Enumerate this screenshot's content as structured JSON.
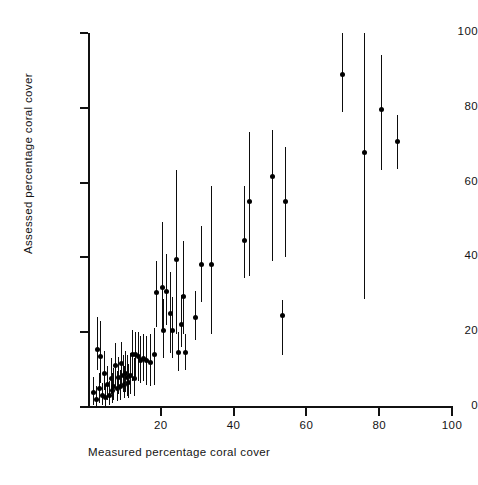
{
  "figure": {
    "background_color": "#ffffff",
    "ink_color": "#111111",
    "marker_color": "#000000"
  },
  "axes": {
    "x": {
      "label": "Measured percentage coral cover",
      "min": 0,
      "max": 100,
      "ticks": [
        0,
        20,
        40,
        60,
        80,
        100
      ],
      "tick_labels": [
        "",
        "20",
        "40",
        "60",
        "80",
        "100"
      ],
      "tick_direction": "out"
    },
    "y": {
      "label": "Assessed percentage coral cover",
      "min": 0,
      "max": 100,
      "ticks": [
        0,
        20,
        40,
        60,
        80,
        100
      ],
      "tick_labels": [
        "0",
        "20",
        "40",
        "60",
        "80",
        "100"
      ],
      "tick_direction": "out"
    },
    "spines": {
      "left": true,
      "bottom": true,
      "top": false,
      "right": false
    },
    "grid": false
  },
  "chart_data": {
    "type": "scatter",
    "title": "",
    "xlabel": "Measured percentage coral cover",
    "ylabel": "Assessed percentage coral cover",
    "xlim": [
      0,
      100
    ],
    "ylim": [
      0,
      100
    ],
    "grid": false,
    "legend": null,
    "error_bars": "vertical",
    "series": [
      {
        "name": "Assessed vs measured coral cover",
        "marker": "filled-circle",
        "points": [
          {
            "x": 1.5,
            "y": 4.0,
            "ylow": 0.5,
            "yhigh": 8.0
          },
          {
            "x": 2.2,
            "y": 2.0,
            "ylow": 0.0,
            "yhigh": 5.5
          },
          {
            "x": 2.6,
            "y": 15.5,
            "ylow": 10.0,
            "yhigh": 24.0
          },
          {
            "x": 3.0,
            "y": 5.0,
            "ylow": 1.0,
            "yhigh": 9.0
          },
          {
            "x": 3.4,
            "y": 13.5,
            "ylow": 6.5,
            "yhigh": 23.0
          },
          {
            "x": 3.8,
            "y": 3.0,
            "ylow": 0.5,
            "yhigh": 6.5
          },
          {
            "x": 4.4,
            "y": 9.0,
            "ylow": 4.5,
            "yhigh": 15.0
          },
          {
            "x": 4.8,
            "y": 2.5,
            "ylow": 0.0,
            "yhigh": 6.0
          },
          {
            "x": 5.3,
            "y": 6.0,
            "ylow": 2.0,
            "yhigh": 11.0
          },
          {
            "x": 5.8,
            "y": 3.0,
            "ylow": 0.5,
            "yhigh": 7.0
          },
          {
            "x": 6.2,
            "y": 7.5,
            "ylow": 3.5,
            "yhigh": 13.0
          },
          {
            "x": 6.6,
            "y": 4.5,
            "ylow": 1.0,
            "yhigh": 9.0
          },
          {
            "x": 7.0,
            "y": 5.5,
            "ylow": 2.0,
            "yhigh": 10.5
          },
          {
            "x": 7.5,
            "y": 11.0,
            "ylow": 5.0,
            "yhigh": 17.0
          },
          {
            "x": 7.9,
            "y": 5.0,
            "ylow": 1.5,
            "yhigh": 9.5
          },
          {
            "x": 8.3,
            "y": 8.0,
            "ylow": 3.5,
            "yhigh": 13.5
          },
          {
            "x": 8.7,
            "y": 5.5,
            "ylow": 2.0,
            "yhigh": 10.0
          },
          {
            "x": 9.1,
            "y": 11.5,
            "ylow": 6.0,
            "yhigh": 17.5
          },
          {
            "x": 9.5,
            "y": 8.5,
            "ylow": 4.0,
            "yhigh": 14.0
          },
          {
            "x": 9.9,
            "y": 6.0,
            "ylow": 2.5,
            "yhigh": 11.0
          },
          {
            "x": 10.3,
            "y": 9.0,
            "ylow": 4.0,
            "yhigh": 15.0
          },
          {
            "x": 10.7,
            "y": 8.0,
            "ylow": 3.0,
            "yhigh": 14.0
          },
          {
            "x": 11.1,
            "y": 6.5,
            "ylow": 2.5,
            "yhigh": 11.5
          },
          {
            "x": 11.6,
            "y": 8.5,
            "ylow": 3.5,
            "yhigh": 14.5
          },
          {
            "x": 12.0,
            "y": 14.0,
            "ylow": 7.0,
            "yhigh": 20.5
          },
          {
            "x": 12.5,
            "y": 7.5,
            "ylow": 3.0,
            "yhigh": 13.0
          },
          {
            "x": 13.0,
            "y": 14.0,
            "ylow": 7.5,
            "yhigh": 20.0
          },
          {
            "x": 13.6,
            "y": 13.5,
            "ylow": 7.0,
            "yhigh": 20.0
          },
          {
            "x": 14.3,
            "y": 12.5,
            "ylow": 6.5,
            "yhigh": 19.0
          },
          {
            "x": 15.0,
            "y": 13.0,
            "ylow": 7.0,
            "yhigh": 19.5
          },
          {
            "x": 16.0,
            "y": 12.5,
            "ylow": 6.0,
            "yhigh": 19.0
          },
          {
            "x": 17.0,
            "y": 12.0,
            "ylow": 5.5,
            "yhigh": 19.5
          },
          {
            "x": 18.0,
            "y": 14.0,
            "ylow": 6.0,
            "yhigh": 21.0
          },
          {
            "x": 18.8,
            "y": 30.5,
            "ylow": 21.5,
            "yhigh": 39.0
          },
          {
            "x": 20.2,
            "y": 32.0,
            "ylow": 20.5,
            "yhigh": 49.5
          },
          {
            "x": 20.7,
            "y": 20.5,
            "ylow": 13.0,
            "yhigh": 29.0
          },
          {
            "x": 21.5,
            "y": 31.0,
            "ylow": 22.0,
            "yhigh": 41.0
          },
          {
            "x": 22.4,
            "y": 25.0,
            "ylow": 14.5,
            "yhigh": 36.0
          },
          {
            "x": 23.0,
            "y": 20.5,
            "ylow": 13.0,
            "yhigh": 29.5
          },
          {
            "x": 24.3,
            "y": 39.5,
            "ylow": 19.5,
            "yhigh": 63.5
          },
          {
            "x": 24.8,
            "y": 14.5,
            "ylow": 9.5,
            "yhigh": 20.0
          },
          {
            "x": 25.6,
            "y": 22.0,
            "ylow": 16.0,
            "yhigh": 30.0
          },
          {
            "x": 26.2,
            "y": 29.5,
            "ylow": 19.5,
            "yhigh": 44.5
          },
          {
            "x": 26.6,
            "y": 14.5,
            "ylow": 10.0,
            "yhigh": 19.5
          },
          {
            "x": 29.4,
            "y": 24.0,
            "ylow": 18.0,
            "yhigh": 31.0
          },
          {
            "x": 31.0,
            "y": 38.0,
            "ylow": 28.0,
            "yhigh": 48.5
          },
          {
            "x": 33.8,
            "y": 38.0,
            "ylow": 19.5,
            "yhigh": 59.0
          },
          {
            "x": 42.8,
            "y": 44.5,
            "ylow": 34.5,
            "yhigh": 59.0
          },
          {
            "x": 44.2,
            "y": 55.0,
            "ylow": 35.0,
            "yhigh": 73.5
          },
          {
            "x": 50.6,
            "y": 61.5,
            "ylow": 39.0,
            "yhigh": 74.0
          },
          {
            "x": 53.4,
            "y": 24.5,
            "ylow": 14.0,
            "yhigh": 28.5
          },
          {
            "x": 54.0,
            "y": 55.0,
            "ylow": 40.0,
            "yhigh": 69.5
          },
          {
            "x": 69.8,
            "y": 89.0,
            "ylow": 79.0,
            "yhigh": 100.0
          },
          {
            "x": 75.8,
            "y": 68.0,
            "ylow": 29.0,
            "yhigh": 100.0
          },
          {
            "x": 80.6,
            "y": 79.5,
            "ylow": 63.5,
            "yhigh": 94.0
          },
          {
            "x": 85.0,
            "y": 71.0,
            "ylow": 63.5,
            "yhigh": 78.0
          }
        ]
      }
    ]
  }
}
